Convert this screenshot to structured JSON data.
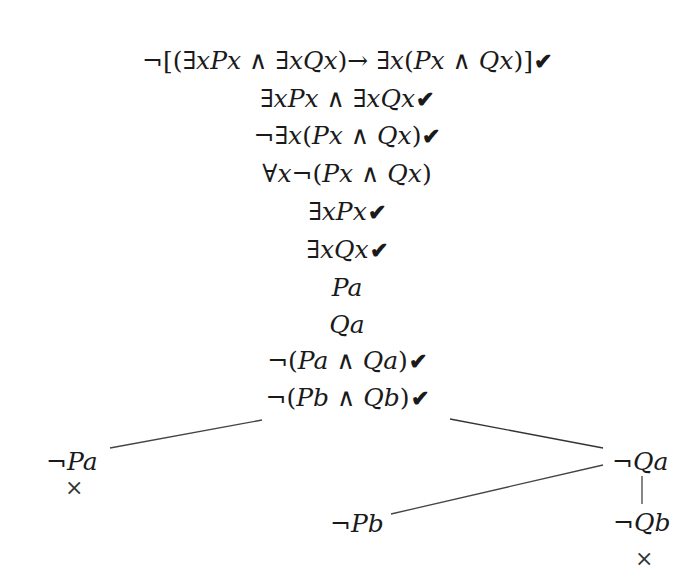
{
  "tree": {
    "trunk": [
      {
        "formula": "¬[(∃xPx ∧ ∃xQx)→ ∃x(Px ∧ Qx)]",
        "checked": true
      },
      {
        "formula": "∃xPx ∧ ∃xQx",
        "checked": true
      },
      {
        "formula": "¬∃x(Px ∧ Qx)",
        "checked": true
      },
      {
        "formula": "∀x¬(Px ∧ Qx)",
        "checked": false
      },
      {
        "formula": "∃xPx",
        "checked": true
      },
      {
        "formula": "∃xQx",
        "checked": true
      },
      {
        "formula": "Pa",
        "checked": false
      },
      {
        "formula": "Qa",
        "checked": false
      },
      {
        "formula": "¬(Pa ∧ Qa)",
        "checked": true
      },
      {
        "formula": "¬(Pb ∧ Qb)",
        "checked": true
      }
    ],
    "check_mark": "✔",
    "close_mark": "×",
    "branches": {
      "left": {
        "formula": "¬Pa",
        "closed": true
      },
      "right": {
        "formula": "¬Qa",
        "children": {
          "left": {
            "formula": "¬Pb",
            "closed": false
          },
          "right": {
            "formula": "¬Qb",
            "closed": true
          }
        }
      }
    }
  }
}
